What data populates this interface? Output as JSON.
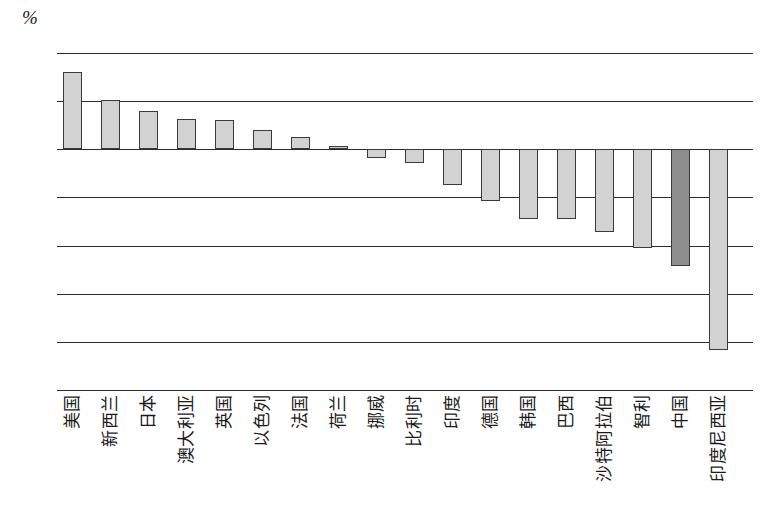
{
  "chart_data": {
    "type": "bar",
    "title": "",
    "subtitle": "",
    "xlabel": "",
    "ylabel": "%",
    "unit_label": "%",
    "ylim": [
      -10,
      4
    ],
    "ytick_values": [
      4,
      2,
      0,
      -2,
      -4,
      -6,
      -8,
      -10
    ],
    "ytick_labels": [
      "4",
      "2",
      "0",
      "−2",
      "−4",
      "−6",
      "−8",
      "−10"
    ],
    "grid": true,
    "grid_axis": "y",
    "legend": null,
    "legend_position": "none",
    "categories": [
      "美国",
      "新西兰",
      "日本",
      "澳大利亚",
      "英国",
      "以色列",
      "法国",
      "荷兰",
      "挪威",
      "比利时",
      "印度",
      "德国",
      "韩国",
      "巴西",
      "沙特阿拉伯",
      "智利",
      "中国",
      "印度尼西亚"
    ],
    "values": [
      3.2,
      2.05,
      1.6,
      1.25,
      1.2,
      0.8,
      0.5,
      0.15,
      -0.35,
      -0.55,
      -1.5,
      -2.15,
      -2.9,
      -2.9,
      -3.45,
      -4.1,
      -4.85,
      -8.35
    ],
    "bar_colors": {
      "default": "#d2d2d2",
      "highlight": "#8e8e8e",
      "edge": "#3a3a3a"
    },
    "highlight_categories": [
      "中国"
    ],
    "axis_color": "#2b2b2b"
  }
}
